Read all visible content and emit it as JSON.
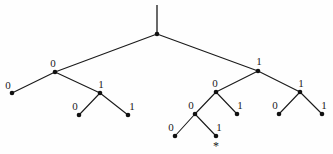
{
  "figure": {
    "background_color": "#fefefe",
    "stroke_color": "#1a1a1a",
    "node_color": "#111111",
    "width": 333,
    "height": 154
  },
  "chart_data": {
    "type": "diagram",
    "subtype": "binary-tree",
    "title": "",
    "xlabel": "",
    "ylabel": "",
    "nodes": [
      {
        "id": "root",
        "x": 157,
        "y": 34,
        "label": "",
        "label_x": 0,
        "label_y": 0,
        "is_leaf": false,
        "depth": 0
      },
      {
        "id": "n0",
        "x": 55,
        "y": 72,
        "label": "0",
        "label_x": 53,
        "label_y": 63,
        "is_leaf": false,
        "depth": 1
      },
      {
        "id": "n1",
        "x": 258,
        "y": 71,
        "label": "1",
        "label_x": 259,
        "label_y": 61,
        "is_leaf": false,
        "depth": 1
      },
      {
        "id": "n00",
        "x": 12,
        "y": 93,
        "label": "0",
        "label_x": 8,
        "label_y": 85,
        "is_leaf": true,
        "depth": 2
      },
      {
        "id": "n01",
        "x": 100,
        "y": 93,
        "label": "1",
        "label_x": 101,
        "label_y": 84,
        "is_leaf": false,
        "depth": 2
      },
      {
        "id": "n10",
        "x": 216,
        "y": 92,
        "label": "0",
        "label_x": 215,
        "label_y": 83,
        "is_leaf": false,
        "depth": 2
      },
      {
        "id": "n11",
        "x": 300,
        "y": 92,
        "label": "1",
        "label_x": 301,
        "label_y": 83,
        "is_leaf": false,
        "depth": 2
      },
      {
        "id": "n010",
        "x": 79,
        "y": 115,
        "label": "0",
        "label_x": 75,
        "label_y": 106,
        "is_leaf": true,
        "depth": 3
      },
      {
        "id": "n011",
        "x": 128,
        "y": 115,
        "label": "1",
        "label_x": 132,
        "label_y": 106,
        "is_leaf": true,
        "depth": 3
      },
      {
        "id": "n100",
        "x": 195,
        "y": 114,
        "label": "0",
        "label_x": 191,
        "label_y": 105,
        "is_leaf": false,
        "depth": 3
      },
      {
        "id": "n101",
        "x": 237,
        "y": 114,
        "label": "1",
        "label_x": 240,
        "label_y": 105,
        "is_leaf": true,
        "depth": 3
      },
      {
        "id": "n110",
        "x": 279,
        "y": 114,
        "label": "0",
        "label_x": 275,
        "label_y": 105,
        "is_leaf": true,
        "depth": 3
      },
      {
        "id": "n111",
        "x": 322,
        "y": 114,
        "label": "1",
        "label_x": 324,
        "label_y": 105,
        "is_leaf": true,
        "depth": 3
      },
      {
        "id": "n1000",
        "x": 175,
        "y": 136,
        "label": "0",
        "label_x": 171,
        "label_y": 127,
        "is_leaf": true,
        "depth": 4
      },
      {
        "id": "n1001",
        "x": 216,
        "y": 136,
        "label": "1",
        "label_x": 219,
        "label_y": 127,
        "is_leaf": true,
        "depth": 4
      }
    ],
    "edges": [
      {
        "from": "root",
        "to": "n0"
      },
      {
        "from": "root",
        "to": "n1"
      },
      {
        "from": "n0",
        "to": "n00"
      },
      {
        "from": "n0",
        "to": "n01"
      },
      {
        "from": "n01",
        "to": "n010"
      },
      {
        "from": "n01",
        "to": "n011"
      },
      {
        "from": "n1",
        "to": "n10"
      },
      {
        "from": "n1",
        "to": "n11"
      },
      {
        "from": "n10",
        "to": "n100"
      },
      {
        "from": "n10",
        "to": "n101"
      },
      {
        "from": "n11",
        "to": "n110"
      },
      {
        "from": "n11",
        "to": "n111"
      },
      {
        "from": "n100",
        "to": "n1000"
      },
      {
        "from": "n100",
        "to": "n1001"
      }
    ],
    "root_stem": {
      "x": 157,
      "y_top": 5,
      "y_bottom": 34
    },
    "annotations": [
      {
        "id": "star-marker",
        "symbol": "*",
        "x": 216,
        "y": 146,
        "attached_to": "n1001"
      }
    ],
    "node_radius": 2.3,
    "labels_text": [
      "0",
      "1",
      "0",
      "1",
      "0",
      "1",
      "0",
      "1",
      "0",
      "1",
      "0",
      "1",
      "0",
      "1"
    ],
    "legend": [],
    "grid": false
  }
}
